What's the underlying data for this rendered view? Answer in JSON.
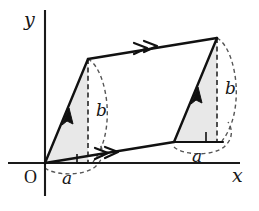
{
  "figure": {
    "type": "geometry-diagram",
    "background_color": "#ffffff",
    "ink_color": "#111111",
    "triangle_fill_color": "#e8e8e8"
  },
  "axes": {
    "x_label": "x",
    "y_label": "y",
    "origin_label": "O"
  },
  "labels": {
    "left_triangle_base": "a",
    "left_triangle_height": "b",
    "right_triangle_base": "a",
    "right_triangle_height": "b"
  },
  "geometry": {
    "vertices": {
      "origin": [
        45,
        163
      ],
      "top_left": [
        88,
        59
      ],
      "top_right": [
        217,
        38
      ],
      "bottom_right": [
        174,
        142
      ]
    },
    "left_triangle": [
      [
        45,
        163
      ],
      [
        88,
        59
      ],
      [
        88,
        163
      ]
    ],
    "right_triangle": [
      [
        174,
        142
      ],
      [
        217,
        38
      ],
      [
        217,
        142
      ]
    ]
  },
  "edge_markers": {
    "bottom_edge": "double-chevron",
    "top_edge": "double-chevron",
    "left_edge": "single-arrowhead",
    "right_edge": "single-arrowhead"
  }
}
